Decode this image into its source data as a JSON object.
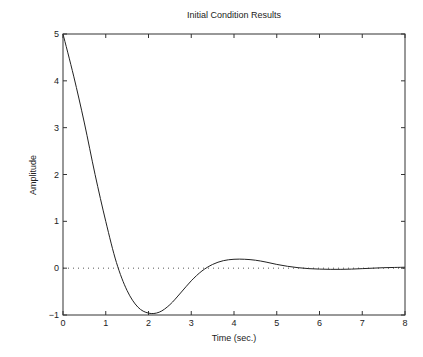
{
  "chart_data": {
    "type": "line",
    "title": "Initial Condition Results",
    "xlabel": "Time (sec.)",
    "ylabel": "Amplitude",
    "xlim": [
      0,
      8
    ],
    "ylim": [
      -1,
      5
    ],
    "xticks": [
      0,
      1,
      2,
      3,
      4,
      5,
      6,
      7,
      8
    ],
    "yticks": [
      -1,
      0,
      1,
      2,
      3,
      4,
      5
    ],
    "grid": false,
    "legend": null,
    "reference_line": {
      "y": 0,
      "style": "dotted"
    },
    "series": [
      {
        "name": "response",
        "x": [
          0,
          0.25,
          0.5,
          0.75,
          1.0,
          1.25,
          1.5,
          1.75,
          2.0,
          2.25,
          2.5,
          2.75,
          3.0,
          3.25,
          3.5,
          3.75,
          4.0,
          4.25,
          4.5,
          4.75,
          5.0,
          5.25,
          5.5,
          5.75,
          6.0,
          6.25,
          6.5,
          6.75,
          7.0,
          7.25,
          7.5,
          7.75,
          8.0
        ],
        "y": [
          5.0,
          4.1,
          3.1,
          2.0,
          1.0,
          0.12,
          -0.48,
          -0.83,
          -0.96,
          -0.94,
          -0.78,
          -0.53,
          -0.27,
          -0.06,
          0.08,
          0.16,
          0.19,
          0.19,
          0.17,
          0.13,
          0.08,
          0.04,
          0.01,
          -0.01,
          -0.02,
          -0.025,
          -0.025,
          -0.02,
          -0.01,
          0.0,
          0.01,
          0.015,
          0.02
        ]
      }
    ]
  }
}
